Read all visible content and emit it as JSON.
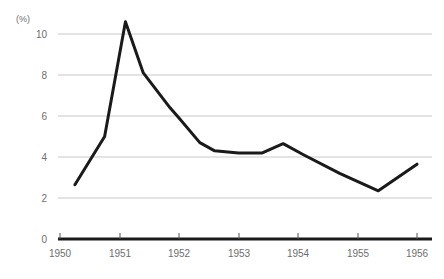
{
  "chart_data": {
    "type": "line",
    "title": "",
    "subtitle": "",
    "xlabel": "",
    "ylabel": "(%)",
    "unit_label": "(%)",
    "xlim": [
      1949.75,
      1956.0
    ],
    "ylim": [
      0,
      11.2
    ],
    "yticks": [
      0,
      2,
      4,
      6,
      8,
      10
    ],
    "ytick_labels": [
      "0",
      "2",
      "4",
      "6",
      "8",
      "10"
    ],
    "xticks": [
      1950,
      1951,
      1952,
      1953,
      1954,
      1955,
      1956
    ],
    "xtick_labels": [
      "1950",
      "1951",
      "1952",
      "1953",
      "1954",
      "1955",
      "1956"
    ],
    "grid": true,
    "grid_axis": "y",
    "legend": false,
    "legend_position": "none",
    "line_color": "#1a1a1a",
    "grid_color": "#c8c8c8",
    "axis_color": "#1a1a1a",
    "text_color": "#6e6e6e",
    "background_color": "#ffffff",
    "series": [
      {
        "name": "rate",
        "color": "#1a1a1a",
        "x": [
          1950.25,
          1950.75,
          1951.1,
          1951.4,
          1951.85,
          1952.0,
          1952.35,
          1952.6,
          1953.0,
          1953.4,
          1953.75,
          1954.1,
          1954.7,
          1955.35,
          1956.0
        ],
        "values": [
          2.65,
          5.0,
          10.6,
          8.1,
          6.4,
          5.9,
          4.7,
          4.3,
          4.2,
          4.2,
          4.65,
          4.1,
          3.2,
          2.35,
          3.65
        ]
      }
    ]
  }
}
